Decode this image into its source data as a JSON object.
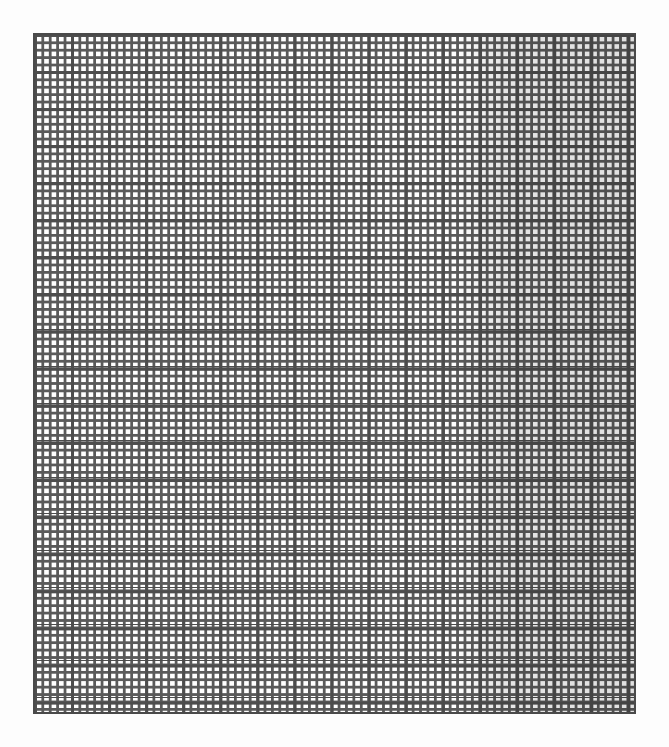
{
  "document": {
    "kind": "graph-paper",
    "description": "Blank square-ruled graph paper sheet"
  },
  "grid": {
    "minor_cells_per_major": 5,
    "major_columns": 16.2,
    "major_rows": 18.4,
    "line_color": "#4d4d4d",
    "paper_color": "#ffffff"
  }
}
